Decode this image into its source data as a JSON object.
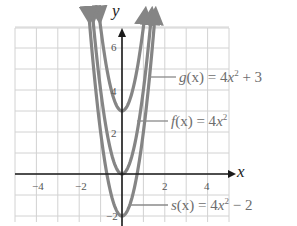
{
  "chart_data": {
    "type": "line",
    "title": "",
    "xlabel": "x",
    "ylabel": "y",
    "xlim": [
      -5,
      5
    ],
    "ylim": [
      -2,
      7
    ],
    "grid": true,
    "x_ticks": [
      -4,
      -2,
      2,
      4
    ],
    "y_ticks": [
      -2,
      2,
      4,
      6
    ],
    "x_tick_labels": [
      "−4",
      "−2",
      "2",
      "4"
    ],
    "y_tick_labels": [
      "−2",
      "2",
      "4",
      "6"
    ],
    "series": [
      {
        "name": "g(x) = 4x² + 3",
        "formula": "4x^2+3",
        "vertex": [
          0,
          3
        ],
        "color": "#808080",
        "x": [
          -1,
          -0.5,
          0,
          0.5,
          1
        ],
        "values": [
          7,
          4,
          3,
          4,
          7
        ]
      },
      {
        "name": "f(x) = 4x²",
        "formula": "4x^2",
        "vertex": [
          0,
          0
        ],
        "color": "#808080",
        "x": [
          -1.5,
          -1,
          -0.5,
          0,
          0.5,
          1,
          1.5
        ],
        "values": [
          9,
          4,
          1,
          0,
          1,
          4,
          9
        ]
      },
      {
        "name": "s(x) = 4x² − 2",
        "formula": "4x^2-2",
        "vertex": [
          0,
          -2
        ],
        "color": "#808080",
        "x": [
          -1.5,
          -1,
          -0.5,
          0,
          0.5,
          1,
          1.5
        ],
        "values": [
          7,
          2,
          -1,
          -2,
          -1,
          2,
          7
        ]
      }
    ],
    "annotations": [
      {
        "text": "g(x) = 4x² + 3",
        "points_to": "g"
      },
      {
        "text": "f(x) = 4x²",
        "points_to": "f"
      },
      {
        "text": "s(x) = 4x² − 2",
        "points_to": "s"
      }
    ],
    "legend_position": "right (leader-line labels)"
  },
  "labels": {
    "x_axis": "x",
    "y_axis": "y",
    "ticks": {
      "xm4": "−4",
      "xm2": "−2",
      "x2": "2",
      "x4": "4",
      "y6": "6",
      "y4": "4",
      "y2": "2",
      "ym2": "−2"
    },
    "g": {
      "lhs": "g",
      "arg": "(x) = 4",
      "var": "x",
      "exp": "2",
      "rhs": " + 3"
    },
    "f": {
      "lhs": "f",
      "arg": "(x) = 4",
      "var": "x",
      "exp": "2",
      "rhs": ""
    },
    "s": {
      "lhs": "s",
      "arg": "(x) = 4",
      "var": "x",
      "exp": "2",
      "rhs": " − 2"
    }
  },
  "colors": {
    "grid": "#cfcfcf",
    "axis": "#1a1a1a",
    "curve": "#858585",
    "text": "#6d6d6d"
  }
}
